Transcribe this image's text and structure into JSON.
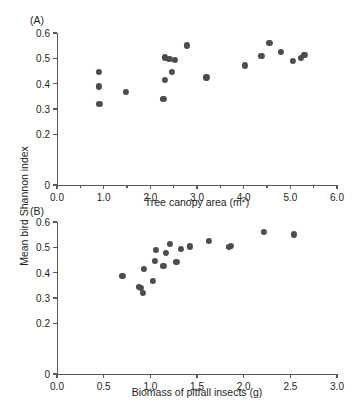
{
  "figure": {
    "shared_y_axis_label": "Mean bird Shannon index",
    "marker_color": "#4d4d4f",
    "axis_color": "#58595b",
    "text_color": "#231f20",
    "background": "#ffffff"
  },
  "panels": [
    {
      "label": "(A)",
      "xlabel_text": "Tree canopy area (m",
      "xlabel_sup": "2",
      "xlabel_tail": ")"
    },
    {
      "label": "(B)",
      "xlabel_text": "Biomass of pitfall insects (g)",
      "xlabel_sup": "",
      "xlabel_tail": ""
    }
  ],
  "chart_data": [
    {
      "type": "scatter",
      "panel": "(A)",
      "title": "",
      "xlabel": "Tree canopy area (m2)",
      "ylabel": "Mean bird Shannon index",
      "xlim": [
        0.0,
        6.0
      ],
      "ylim": [
        0.0,
        0.6
      ],
      "xticks": [
        0.0,
        1.0,
        2.0,
        3.0,
        4.0,
        5.0,
        6.0
      ],
      "xticklabels": [
        "0.0",
        "1.0",
        "2.0",
        "3.0",
        "4.0",
        "5.0",
        "6.0"
      ],
      "xminorticks": [
        0.5,
        1.5,
        2.5,
        3.5,
        4.5,
        5.5
      ],
      "yticks": [
        0.0,
        0.2,
        0.3,
        0.4,
        0.5,
        0.6
      ],
      "yticklabels": [
        "0",
        "0.2",
        "0.3",
        "0.4",
        "0.5",
        "0.6"
      ],
      "grid": false,
      "legend": "none",
      "points": [
        {
          "x": 0.9,
          "y": 0.448
        },
        {
          "x": 0.9,
          "y": 0.389
        },
        {
          "x": 0.91,
          "y": 0.32
        },
        {
          "x": 1.47,
          "y": 0.367
        },
        {
          "x": 2.28,
          "y": 0.341
        },
        {
          "x": 2.32,
          "y": 0.414
        },
        {
          "x": 2.31,
          "y": 0.504
        },
        {
          "x": 2.41,
          "y": 0.497
        },
        {
          "x": 2.47,
          "y": 0.447
        },
        {
          "x": 2.53,
          "y": 0.494
        },
        {
          "x": 2.79,
          "y": 0.551
        },
        {
          "x": 3.2,
          "y": 0.425
        },
        {
          "x": 4.02,
          "y": 0.472
        },
        {
          "x": 4.38,
          "y": 0.508
        },
        {
          "x": 4.55,
          "y": 0.561
        },
        {
          "x": 4.8,
          "y": 0.525
        },
        {
          "x": 5.05,
          "y": 0.491
        },
        {
          "x": 5.23,
          "y": 0.503
        },
        {
          "x": 5.29,
          "y": 0.512
        },
        {
          "x": 5.32,
          "y": 0.515
        }
      ]
    },
    {
      "type": "scatter",
      "panel": "(B)",
      "title": "",
      "xlabel": "Biomass of pitfall insects (g)",
      "ylabel": "Mean bird Shannon index",
      "xlim": [
        0.0,
        3.0
      ],
      "ylim": [
        0.0,
        0.6
      ],
      "xticks": [
        0.0,
        0.5,
        1.0,
        1.5,
        2.0,
        2.5,
        3.0
      ],
      "xticklabels": [
        "0.0",
        "0.5",
        "1.0",
        "1.5",
        "2.0",
        "2.5",
        "3.0"
      ],
      "xminorticks": [],
      "yticks": [
        0.0,
        0.2,
        0.3,
        0.4,
        0.5,
        0.6
      ],
      "yticklabels": [
        "0",
        "0.2",
        "0.3",
        "0.4",
        "0.5",
        "0.6"
      ],
      "grid": false,
      "legend": "none",
      "points": [
        {
          "x": 0.7,
          "y": 0.388
        },
        {
          "x": 0.88,
          "y": 0.344
        },
        {
          "x": 0.9,
          "y": 0.341
        },
        {
          "x": 0.92,
          "y": 0.32
        },
        {
          "x": 0.93,
          "y": 0.414
        },
        {
          "x": 1.03,
          "y": 0.366
        },
        {
          "x": 1.05,
          "y": 0.447
        },
        {
          "x": 1.06,
          "y": 0.491
        },
        {
          "x": 1.14,
          "y": 0.426
        },
        {
          "x": 1.17,
          "y": 0.477
        },
        {
          "x": 1.21,
          "y": 0.515
        },
        {
          "x": 1.28,
          "y": 0.444
        },
        {
          "x": 1.33,
          "y": 0.494
        },
        {
          "x": 1.42,
          "y": 0.504
        },
        {
          "x": 1.63,
          "y": 0.525
        },
        {
          "x": 1.84,
          "y": 0.503
        },
        {
          "x": 1.86,
          "y": 0.505
        },
        {
          "x": 2.22,
          "y": 0.561
        },
        {
          "x": 2.54,
          "y": 0.551
        }
      ]
    }
  ]
}
